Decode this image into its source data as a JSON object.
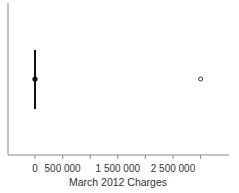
{
  "chart_data": {
    "type": "boxplot",
    "title": "",
    "xlabel": "March 2012 Charges",
    "ylabel": "",
    "xlim": [
      -500000,
      3500000
    ],
    "x_ticks": [
      0,
      500000,
      1000000,
      1500000,
      2000000,
      2500000,
      3000000
    ],
    "x_tick_labels": [
      "0",
      "500 000",
      "",
      "1 500 000",
      "",
      "2 500 000",
      ""
    ],
    "grid": false,
    "series": [
      {
        "name": "March 2012 Charges",
        "whisker_low": 0,
        "whisker_high": 0,
        "median": 0,
        "point_estimate": 0,
        "outliers": [
          3000000
        ]
      }
    ],
    "colors": {
      "axis": "#888888",
      "whisker": "#111111",
      "outlier": "#333333",
      "text": "#333333"
    }
  }
}
